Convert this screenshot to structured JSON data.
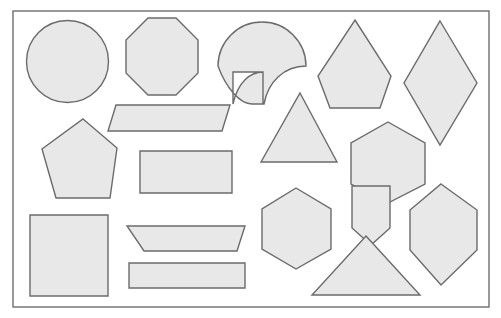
{
  "canvas": {
    "width": 501,
    "height": 318,
    "background_color": "#ffffff",
    "title": "Geometric Shapes Sheet"
  },
  "frame": {
    "name": "outer-border",
    "x": 13,
    "y": 11,
    "width": 476,
    "height": 296,
    "stroke_color": "#6e6e6e",
    "stroke_width": 1.4,
    "fill": "none"
  },
  "style": {
    "shape_fill": "#e8e8e8",
    "shape_stroke": "#6b6b6b",
    "shape_stroke_width": 1.4
  },
  "shapes": [
    {
      "id": "circle",
      "label": "Circle",
      "kind": "circle",
      "cx": 67.5,
      "cy": 61.5,
      "r": 41,
      "sides": 0
    },
    {
      "id": "octagon",
      "label": "Octagon",
      "kind": "polygon",
      "sides": 8,
      "points": "148,18 176,18 198,40 198,73 176,95 148,95 126,73 126,40"
    },
    {
      "id": "fan",
      "label": "Fan / Shell",
      "kind": "path",
      "sides": 0,
      "path": "M 218,66 A 44 44 0 0 1 306,66 L 306,66 C 284,66 268,82 264,104 L 263,104 L 263,72 L 233,72 L 233,104 C 238,82 250,72 263,72 L 263,104 L 252,104 C 240,104 226,88 218,66 Z"
    },
    {
      "id": "kite-pentagon",
      "label": "Kite Pentagon",
      "kind": "polygon",
      "sides": 5,
      "points": "355,20 391,76 380,108 330,108 318,76"
    },
    {
      "id": "rhombus",
      "label": "Rhombus",
      "kind": "polygon",
      "sides": 4,
      "points": "440,21 477,83 440,145 404,83"
    },
    {
      "id": "parallelogram",
      "label": "Parallelogram",
      "kind": "polygon",
      "sides": 4,
      "points": "116,105 230,105 222,131 108,131"
    },
    {
      "id": "pentagon",
      "label": "Pentagon",
      "kind": "polygon",
      "sides": 5,
      "points": "83,119 117,148 110,198 56,198 42,149"
    },
    {
      "id": "rectangle-large",
      "label": "Rectangle",
      "kind": "polygon",
      "sides": 4,
      "points": "140,151 232,151 232,193 140,193"
    },
    {
      "id": "triangle-isosceles",
      "label": "Isosceles Triangle",
      "kind": "polygon",
      "sides": 3,
      "points": "300,93 337,162 261,162"
    },
    {
      "id": "hexagon-right",
      "label": "Hexagon",
      "kind": "polygon",
      "sides": 6,
      "points": "388,122 425,143 425,184 388,203 351,184 351,143"
    },
    {
      "id": "square",
      "label": "Square",
      "kind": "polygon",
      "sides": 4,
      "points": "30,215 108,215 108,296 30,296"
    },
    {
      "id": "trapezoid-inverted",
      "label": "Inverted Trapezoid",
      "kind": "polygon",
      "sides": 4,
      "points": "127,226 245,226 237,251 144,251"
    },
    {
      "id": "hexagon-center",
      "label": "Hexagon",
      "kind": "polygon",
      "sides": 6,
      "points": "296,188 331,209 331,249 296,269 262,249 262,209"
    },
    {
      "id": "pentagon-home",
      "label": "Home Pentagon",
      "kind": "polygon",
      "sides": 5,
      "points": "352,186 390,186 390,228 371,245 352,228"
    },
    {
      "id": "hexagon-elongated",
      "label": "Elongated Hexagon",
      "kind": "polygon",
      "sides": 6,
      "points": "441,184 477,210 477,250 441,285 410,250 410,210"
    },
    {
      "id": "rectangle-thin",
      "label": "Thin Rectangle",
      "kind": "polygon",
      "sides": 4,
      "points": "129,263 245,263 245,288 129,288"
    },
    {
      "id": "triangle-wide",
      "label": "Wide Triangle",
      "kind": "polygon",
      "sides": 3,
      "points": "366,236 420,295 312,295"
    }
  ]
}
